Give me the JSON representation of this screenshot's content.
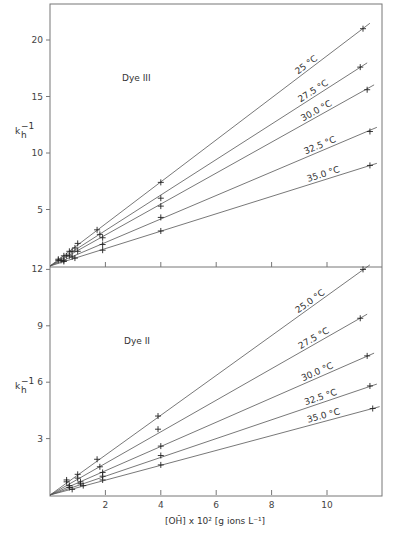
{
  "chart_data": [
    {
      "type": "line",
      "panel": "top",
      "annotation": "Dye III",
      "ylabel": "k_h^-1",
      "xlabel": "",
      "ylim": [
        0,
        23
      ],
      "xlim": [
        0,
        12
      ],
      "yticks": [
        5,
        10,
        15,
        20
      ],
      "xticks": [
        2,
        4,
        6,
        8,
        10
      ],
      "grid": false,
      "series": [
        {
          "name": "25°C",
          "label": "25 °C",
          "slope": 1.86,
          "points": [
            [
              0.3,
              0.6
            ],
            [
              0.5,
              0.9
            ],
            [
              0.7,
              1.3
            ],
            [
              0.9,
              1.6
            ],
            [
              1.0,
              2.0
            ],
            [
              1.7,
              3.2
            ],
            [
              4.0,
              7.4
            ],
            [
              11.3,
              21.0
            ]
          ]
        },
        {
          "name": "27.5°C",
          "label": "27.5 °C",
          "slope": 1.57,
          "points": [
            [
              0.3,
              0.5
            ],
            [
              0.6,
              0.9
            ],
            [
              0.8,
              1.3
            ],
            [
              1.8,
              2.8
            ],
            [
              4.0,
              6.0
            ],
            [
              11.2,
              17.6
            ]
          ]
        },
        {
          "name": "30.0°C",
          "label": "30.0 °C",
          "slope": 1.37,
          "points": [
            [
              0.4,
              0.5
            ],
            [
              0.7,
              0.9
            ],
            [
              1.0,
              1.3
            ],
            [
              1.9,
              2.5
            ],
            [
              4.0,
              5.3
            ],
            [
              11.45,
              15.6
            ]
          ]
        },
        {
          "name": "32.5°C",
          "label": "32.5 °C",
          "slope": 1.04,
          "points": [
            [
              0.5,
              0.5
            ],
            [
              0.8,
              0.8
            ],
            [
              1.9,
              1.9
            ],
            [
              4.0,
              4.3
            ],
            [
              11.55,
              11.9
            ]
          ]
        },
        {
          "name": "35.0°C",
          "label": "35.0 °C",
          "slope": 0.77,
          "points": [
            [
              0.5,
              0.4
            ],
            [
              0.9,
              0.7
            ],
            [
              1.9,
              1.4
            ],
            [
              4.0,
              3.1
            ],
            [
              11.55,
              8.9
            ]
          ]
        }
      ]
    },
    {
      "type": "line",
      "panel": "bottom",
      "annotation": "Dye II",
      "ylabel": "k_h^-1",
      "xlabel": "[OH⁻] x 10² [g ions L⁻¹]",
      "ylim": [
        0,
        12
      ],
      "xlim": [
        0,
        12
      ],
      "yticks": [
        3,
        6,
        9,
        12
      ],
      "xticks": [
        2,
        4,
        6,
        8,
        10
      ],
      "grid": false,
      "series": [
        {
          "name": "25.0°C",
          "label": "25.0 °C",
          "slope": 1.06,
          "points": [
            [
              0.6,
              0.8
            ],
            [
              1.0,
              1.1
            ],
            [
              1.7,
              1.9
            ],
            [
              3.9,
              4.2
            ],
            [
              11.3,
              12.0
            ]
          ]
        },
        {
          "name": "27.5°C",
          "label": "27.5 °C",
          "slope": 0.84,
          "points": [
            [
              0.6,
              0.7
            ],
            [
              1.0,
              0.9
            ],
            [
              1.8,
              1.5
            ],
            [
              3.9,
              3.5
            ],
            [
              11.2,
              9.4
            ]
          ]
        },
        {
          "name": "30.0°C",
          "label": "30.0 °C",
          "slope": 0.645,
          "points": [
            [
              0.7,
              0.5
            ],
            [
              1.1,
              0.7
            ],
            [
              1.9,
              1.2
            ],
            [
              4.0,
              2.6
            ],
            [
              11.45,
              7.4
            ]
          ]
        },
        {
          "name": "32.5°C",
          "label": "32.5 °C",
          "slope": 0.5,
          "points": [
            [
              0.7,
              0.4
            ],
            [
              1.1,
              0.6
            ],
            [
              1.9,
              1.0
            ],
            [
              4.0,
              2.1
            ],
            [
              11.55,
              5.8
            ]
          ]
        },
        {
          "name": "35.0°C",
          "label": "35.0 °C",
          "slope": 0.395,
          "points": [
            [
              0.8,
              0.3
            ],
            [
              1.2,
              0.5
            ],
            [
              1.9,
              0.8
            ],
            [
              4.0,
              1.6
            ],
            [
              11.65,
              4.6
            ]
          ]
        }
      ]
    }
  ],
  "top_panel": {
    "annotation": "Dye III",
    "ylabel_main": "k",
    "ylabel_sub": "h",
    "ylabel_sup": "−1",
    "ytick_labels": [
      "5",
      "10",
      "15",
      "20"
    ],
    "series_labels": [
      "25 °C",
      "27.5 °C",
      "30.0 °C",
      "32.5 °C",
      "35.0 °C"
    ]
  },
  "bottom_panel": {
    "annotation": "Dye II",
    "ylabel_main": "k",
    "ylabel_sub": "h",
    "ylabel_sup": "−1",
    "ytick_labels": [
      "3",
      "6",
      "9",
      "12"
    ],
    "xtick_labels": [
      "2",
      "4",
      "6",
      "8",
      "10"
    ],
    "series_labels": [
      "25.0 °C",
      "27.5 °C",
      "30.0 °C",
      "32.5 °C",
      "35.0 °C"
    ],
    "xlabel": "[OH̄] x 10² [g ions L⁻¹]"
  }
}
